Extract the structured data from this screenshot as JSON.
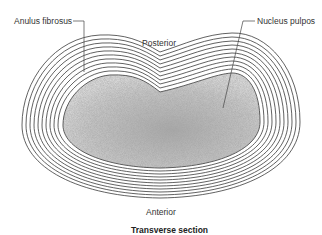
{
  "diagram": {
    "title": "Transverse section",
    "labels": {
      "anulus": "Anulus fibrosus",
      "nucleus": "Nucleus pulpos",
      "posterior": "Posterior",
      "anterior": "Anterior"
    },
    "structure": {
      "lamellae_count": 11,
      "line_color": "#3a3a3a",
      "nucleus_fill": "#b8b8b8",
      "nucleus_edge": "#444444"
    }
  }
}
